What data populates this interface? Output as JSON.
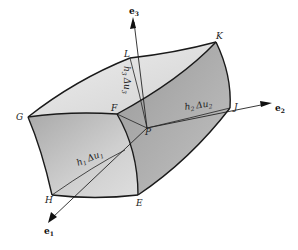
{
  "figure": {
    "axes": [
      {
        "id": "e1",
        "label": "e",
        "subscript": "1"
      },
      {
        "id": "e2",
        "label": "e",
        "subscript": "2"
      },
      {
        "id": "e3",
        "label": "e",
        "subscript": "3"
      }
    ],
    "vertices": [
      "E",
      "F",
      "G",
      "H",
      "J",
      "K",
      "L",
      "P"
    ],
    "edge_lengths": [
      {
        "id": "h1",
        "text": "h",
        "sub": "1",
        "delta": "Δu",
        "dsub": "1"
      },
      {
        "id": "h2",
        "text": "h",
        "sub": "2",
        "delta": "Δu",
        "dsub": "2"
      },
      {
        "id": "h3",
        "text": "h",
        "sub": "3",
        "delta": "Δu",
        "dsub": "3"
      }
    ],
    "colors": {
      "top_face": "#e4e4e4",
      "front_face": "#b8b8b8",
      "right_face": "#a8a8a8",
      "edge": "#1a1a1a"
    }
  }
}
